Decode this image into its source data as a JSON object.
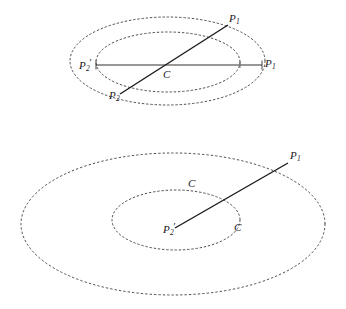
{
  "figure": {
    "background_color": "#ffffff",
    "ink_color": "#1a1a1a",
    "dash_color": "#3a3a3a",
    "top_diagram": {
      "name": "concentric-ellipses-with-two-chords",
      "ellipses": [
        {
          "name": "outer-ellipse",
          "cx": 167.5,
          "cy": 61,
          "rx": 97.5,
          "ry": 44
        },
        {
          "name": "inner-ellipse",
          "cx": 168,
          "cy": 62,
          "rx": 72,
          "ry": 30
        }
      ],
      "segments": [
        {
          "name": "horizontal-chord",
          "x1": 96,
          "y1": 65,
          "x2": 262,
          "y2": 65
        },
        {
          "name": "diagonal-chord",
          "x1": 120,
          "y1": 94,
          "x2": 228,
          "y2": 25
        }
      ],
      "ticks": [
        {
          "name": "tick-left-p2prime",
          "x": 96,
          "y": 65
        },
        {
          "name": "tick-right-p1",
          "x": 262,
          "y": 65
        },
        {
          "name": "tick-inner-right",
          "x": 240,
          "y": 65
        }
      ],
      "labels": [
        {
          "name": "label-p1-upper",
          "base": "P",
          "sub": "1",
          "prime": false,
          "x": 229,
          "y": 13
        },
        {
          "name": "label-p1-right",
          "base": "P",
          "sub": "1",
          "prime": false,
          "x": 265,
          "y": 58
        },
        {
          "name": "label-p2-prime-left",
          "base": "P",
          "sub": "2",
          "prime": true,
          "x": 79,
          "y": 58
        },
        {
          "name": "label-p2-lower",
          "base": "P",
          "sub": "2",
          "prime": false,
          "x": 109,
          "y": 90
        },
        {
          "name": "label-center-c",
          "base": "C",
          "sub": "",
          "prime": false,
          "x": 163,
          "y": 69
        }
      ]
    },
    "bottom_diagram": {
      "name": "concentric-ellipses-with-radius",
      "ellipses": [
        {
          "name": "outer-ellipse",
          "cx": 173,
          "cy": 224,
          "rx": 152,
          "ry": 71
        },
        {
          "name": "inner-ellipse",
          "cx": 176,
          "cy": 220,
          "rx": 64,
          "ry": 30
        }
      ],
      "segments": [
        {
          "name": "radius-segment",
          "x1": 175,
          "y1": 228,
          "x2": 288,
          "y2": 163
        }
      ],
      "labels": [
        {
          "name": "label-p1",
          "base": "P",
          "sub": "1",
          "prime": false,
          "x": 290,
          "y": 150
        },
        {
          "name": "label-p2-prime",
          "base": "P",
          "sub": "2",
          "prime": true,
          "x": 163,
          "y": 222
        },
        {
          "name": "label-c-upper",
          "base": "C",
          "sub": "",
          "prime": false,
          "x": 188,
          "y": 178
        },
        {
          "name": "label-c-lower",
          "base": "C",
          "sub": "",
          "prime": false,
          "x": 234,
          "y": 222
        }
      ]
    }
  }
}
